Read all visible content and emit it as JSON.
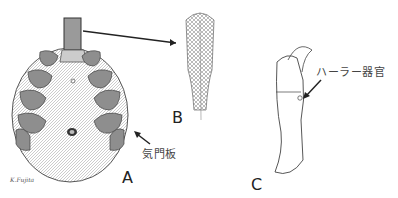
{
  "figure": {
    "panels": [
      {
        "id": "A",
        "label": "A",
        "description": "tick ventral view"
      },
      {
        "id": "B",
        "label": "B",
        "description": "hypostome detail"
      },
      {
        "id": "C",
        "label": "C",
        "description": "first leg tarsus"
      }
    ],
    "annotations": {
      "spiracular_plate": "気門板",
      "hallers_organ": "ハーラー器官"
    },
    "signature": "K.Fujita",
    "colors": {
      "ink": "#333333",
      "shade": "#8a8a8a",
      "background": "#ffffff"
    }
  }
}
